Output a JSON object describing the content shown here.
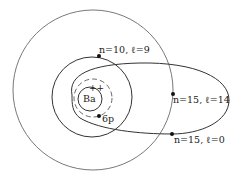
{
  "diagram": {
    "core_label": "Ba",
    "core_charge": "++",
    "inner_electron_label": "6p",
    "orbits": [
      {
        "label": "n=10, ℓ=9",
        "shape": "circle"
      },
      {
        "label": "n=15, ℓ=14",
        "shape": "circle"
      },
      {
        "label": "n=15, ℓ=0",
        "shape": "ellipse"
      }
    ],
    "colors": {
      "line": "#333333",
      "background": "#ffffff"
    }
  }
}
